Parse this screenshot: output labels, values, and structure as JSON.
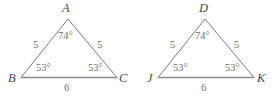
{
  "figure": {
    "caption_text": "",
    "stroke_color": "#7a7a7a",
    "base_stroke_color": "#8a8a8a",
    "label_color": "#6f6f6f",
    "vertex_label_color": "#4a4a4a"
  },
  "triangles": [
    {
      "name": "triangle-abc",
      "vertices": [
        {
          "label": "A",
          "role": "apex"
        },
        {
          "label": "B",
          "role": "bottom-left"
        },
        {
          "label": "C",
          "role": "bottom-right"
        }
      ],
      "sides": [
        {
          "label": "5",
          "role": "left-leg"
        },
        {
          "label": "5",
          "role": "right-leg"
        },
        {
          "label": "6",
          "role": "base"
        }
      ],
      "angles": [
        {
          "label": "74°",
          "role": "apex"
        },
        {
          "label": "53°",
          "role": "bottom-left"
        },
        {
          "label": "53°",
          "role": "bottom-right"
        }
      ]
    },
    {
      "name": "triangle-djk",
      "vertices": [
        {
          "label": "D",
          "role": "apex"
        },
        {
          "label": "J",
          "role": "bottom-left"
        },
        {
          "label": "K",
          "role": "bottom-right"
        }
      ],
      "sides": [
        {
          "label": "5",
          "role": "left-leg"
        },
        {
          "label": "5",
          "role": "right-leg"
        },
        {
          "label": "6",
          "role": "base"
        }
      ],
      "angles": [
        {
          "label": "74°",
          "role": "apex"
        },
        {
          "label": "53°",
          "role": "bottom-left"
        },
        {
          "label": "53°",
          "role": "bottom-right"
        }
      ]
    }
  ]
}
